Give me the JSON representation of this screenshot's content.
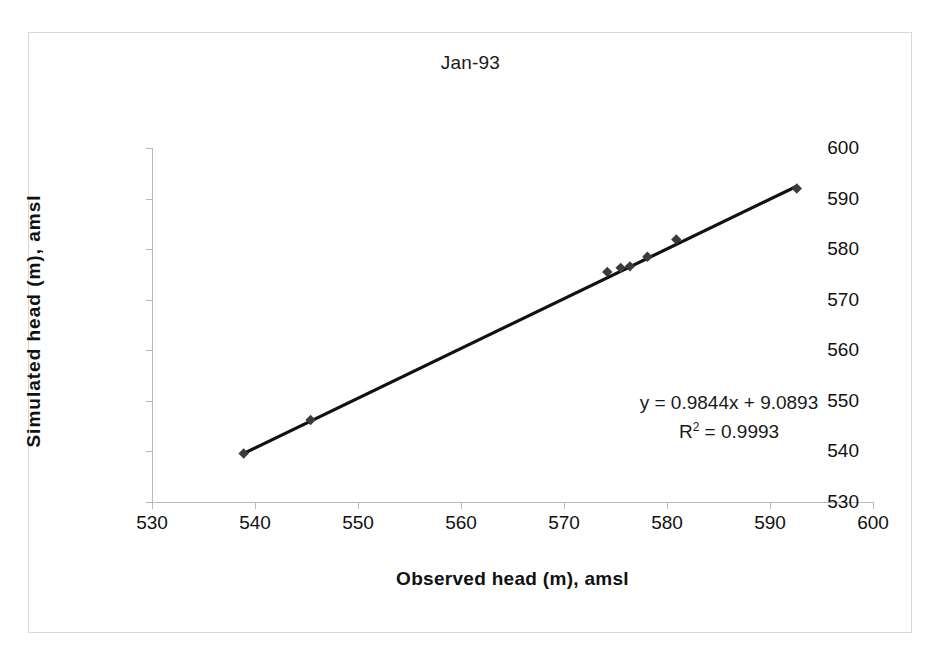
{
  "chart_data": {
    "type": "scatter",
    "title": "Jan-93",
    "xlabel": "Observed head (m), amsl",
    "ylabel": "Simulated head (m), amsl",
    "xlim": [
      530,
      600
    ],
    "ylim": [
      530,
      600
    ],
    "xticks": [
      530,
      540,
      550,
      560,
      570,
      580,
      590,
      600
    ],
    "yticks": [
      530,
      540,
      550,
      560,
      570,
      580,
      590,
      600
    ],
    "grid": false,
    "legend": false,
    "marker": "diamond",
    "marker_color": "#3b3b3b",
    "line_color": "#111111",
    "series": [
      {
        "name": "Observed vs Simulated head",
        "x": [
          538.9,
          545.4,
          574.2,
          575.5,
          576.4,
          578.1,
          580.9,
          592.6
        ],
        "y": [
          539.6,
          546.2,
          575.5,
          576.3,
          576.6,
          578.5,
          581.9,
          592.0
        ]
      }
    ],
    "trendline": {
      "type": "linear",
      "slope": 0.9844,
      "intercept": 9.0893,
      "r_squared": 0.9993,
      "x_start": 538.9,
      "x_end": 592.6
    },
    "annotations": {
      "equation": "y = 0.9844x + 9.0893",
      "r2_prefix": "R",
      "r2_exponent": "2",
      "r2_value": " = 0.9993"
    }
  },
  "colors": {
    "axis": "#b9b9b9",
    "text": "#111111",
    "frame": "#d8d8d8",
    "series": "#3b3b3b"
  }
}
